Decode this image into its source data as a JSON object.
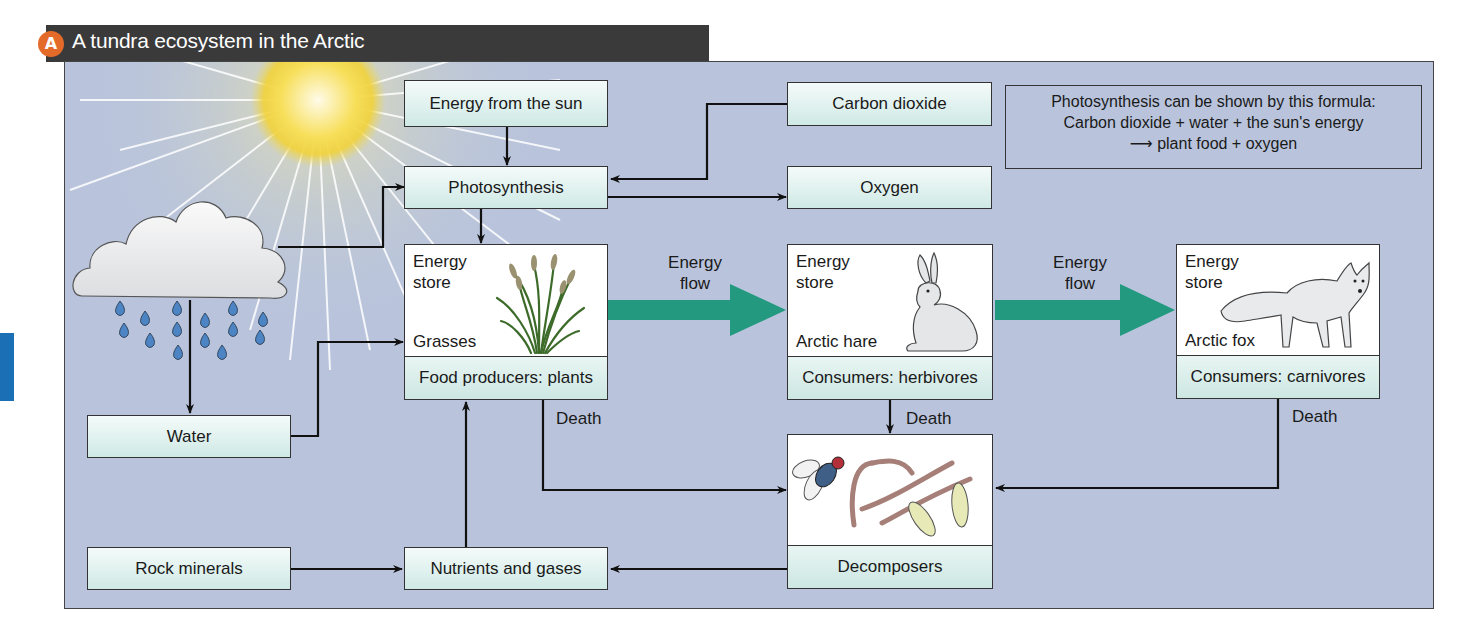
{
  "header": {
    "badge": "A",
    "title": "A tundra ecosystem in the Arctic"
  },
  "colors": {
    "panel_bg": "#b9c4dc",
    "title_bar": "#3a3a3a",
    "badge": "#e46a2a",
    "energy_arrow": "#23997f",
    "side_tab": "#1b6fb5",
    "box_fill": "#dff1ee"
  },
  "boxes": {
    "energy_from_sun": "Energy from the sun",
    "photosynthesis": "Photosynthesis",
    "carbon_dioxide": "Carbon dioxide",
    "oxygen": "Oxygen",
    "water": "Water",
    "rock_minerals": "Rock minerals",
    "nutrients_and_gases": "Nutrients and gases"
  },
  "formula": {
    "line1": "Photosynthesis can be shown by this formula:",
    "line2": "Carbon dioxide + water + the sun's energy",
    "line3": "plant food + oxygen",
    "arrow_glyph": "⟶"
  },
  "cards": {
    "producers": {
      "store_line1": "Energy",
      "store_line2": "store",
      "name": "Grasses",
      "footer": "Food producers: plants",
      "icon": "grass-icon"
    },
    "herbivores": {
      "store_line1": "Energy",
      "store_line2": "store",
      "name": "Arctic hare",
      "footer": "Consumers: herbivores",
      "icon": "hare-icon"
    },
    "carnivores": {
      "store_line1": "Energy",
      "store_line2": "store",
      "name": "Arctic fox",
      "footer": "Consumers: carnivores",
      "icon": "fox-icon"
    },
    "decomposers": {
      "footer": "Decomposers",
      "icon": "decomposers-icon"
    }
  },
  "flow_labels": {
    "energy_flow_1_line1": "Energy",
    "energy_flow_1_line2": "flow",
    "energy_flow_2_line1": "Energy",
    "energy_flow_2_line2": "flow",
    "death_plants": "Death",
    "death_herbivores": "Death",
    "death_carnivores": "Death"
  },
  "illustrations": {
    "sun": "sun-icon",
    "cloud": "rain-cloud-icon"
  }
}
